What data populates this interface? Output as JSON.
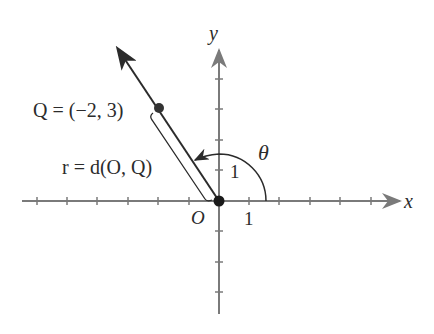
{
  "diagram": {
    "type": "coordinate-plane",
    "axes": {
      "x_label": "x",
      "y_label": "y",
      "origin_label": "O",
      "x_unit_label": "1",
      "y_unit_label": "1"
    },
    "point": {
      "label": "Q = (−2, 3)",
      "coords": [
        -2,
        3
      ]
    },
    "distance_label": "r = d(O, Q)",
    "angle_label": "θ",
    "colors": {
      "axis": "#7a7a7a",
      "line": "#2b2b2b",
      "point": "#333333"
    }
  }
}
